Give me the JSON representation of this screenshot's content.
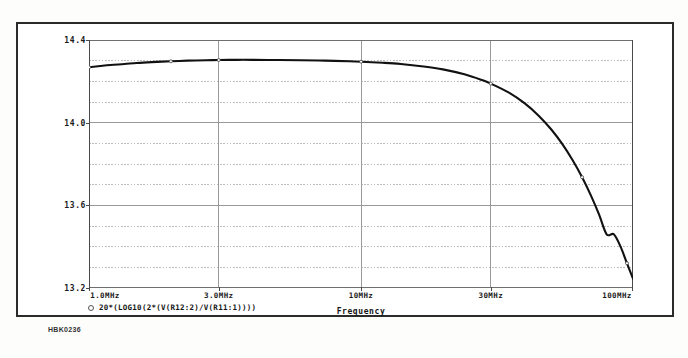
{
  "figure": {
    "caption_id": "HBK0236",
    "background_color": "#ffffff",
    "frame_color": "#2b2b2b"
  },
  "chart_data": {
    "type": "line",
    "title": "",
    "subtitle": "",
    "xlabel": "Frequency",
    "ylabel": "",
    "xscale": "log",
    "yscale": "linear",
    "xlim": [
      1000000,
      100000000
    ],
    "ylim": [
      13.2,
      14.4
    ],
    "grid": true,
    "grid_major_color": "#9a9a9a",
    "grid_minor_color": "#b9b9b9",
    "line_color": "#111111",
    "legend_position": "below-left",
    "ytick_labels": [
      "14.4",
      "14.0",
      "13.6",
      "13.2"
    ],
    "ytick_values": [
      14.4,
      14.0,
      13.6,
      13.2
    ],
    "yminor_step": 0.1,
    "xtick_labels": [
      "1.0MHz",
      "3.0MHz",
      "10MHz",
      "30MHz",
      "100MHz"
    ],
    "xtick_values": [
      1000000,
      3000000,
      10000000,
      30000000,
      100000000
    ],
    "series": [
      {
        "name": "20*(LOG10(2*(V(R12:2)/V(R11:1))))",
        "marker": "circle",
        "x": [
          1000000,
          1100000,
          1200000,
          1350000,
          1500000,
          1700000,
          2000000,
          2300000,
          2700000,
          3000000,
          3500000,
          4000000,
          5000000,
          6000000,
          7000000,
          8000000,
          10000000,
          12000000,
          14000000,
          17000000,
          20000000,
          24000000,
          28000000,
          30000000,
          35000000,
          40000000,
          45000000,
          50000000,
          55000000,
          60000000,
          65000000,
          70000000,
          75000000,
          80000000,
          85000000,
          90000000,
          95000000,
          100000000
        ],
        "y": [
          14.268,
          14.274,
          14.279,
          14.284,
          14.289,
          14.293,
          14.297,
          14.3,
          14.302,
          14.303,
          14.304,
          14.304,
          14.303,
          14.302,
          14.301,
          14.299,
          14.295,
          14.29,
          14.284,
          14.272,
          14.258,
          14.234,
          14.205,
          14.189,
          14.145,
          14.093,
          14.034,
          13.968,
          13.896,
          13.818,
          13.736,
          13.648,
          13.556,
          13.46,
          13.46,
          13.4,
          13.32,
          13.245
        ]
      }
    ]
  }
}
